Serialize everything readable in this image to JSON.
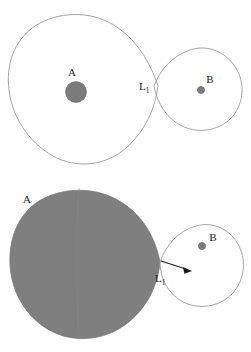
{
  "figure": {
    "background_color": "#fefefe",
    "panels": [
      {
        "id": "top-panel",
        "name": "detached-binary-panel",
        "description": "Two stars within their Roche lobes, touching at the inner Lagrangian point",
        "labels": {
          "primary": "A",
          "secondary": "B",
          "lagrange": "L",
          "lagrange_sub": "1"
        }
      },
      {
        "id": "bottom-panel",
        "name": "semidetached-binary-panel",
        "description": "Primary star fills its Roche lobe; matter streams through the inner Lagrangian point toward the secondary",
        "labels": {
          "primary": "A",
          "secondary": "B",
          "lagrange": "L",
          "lagrange_sub": "1"
        }
      }
    ],
    "colors": {
      "curve_stroke": "#9a9a9a",
      "lobe_fill": "#7f7f7f",
      "star_fill": "#7b7b7b",
      "arrow": "#1c1c1c",
      "text": "#1a1a1a"
    }
  }
}
